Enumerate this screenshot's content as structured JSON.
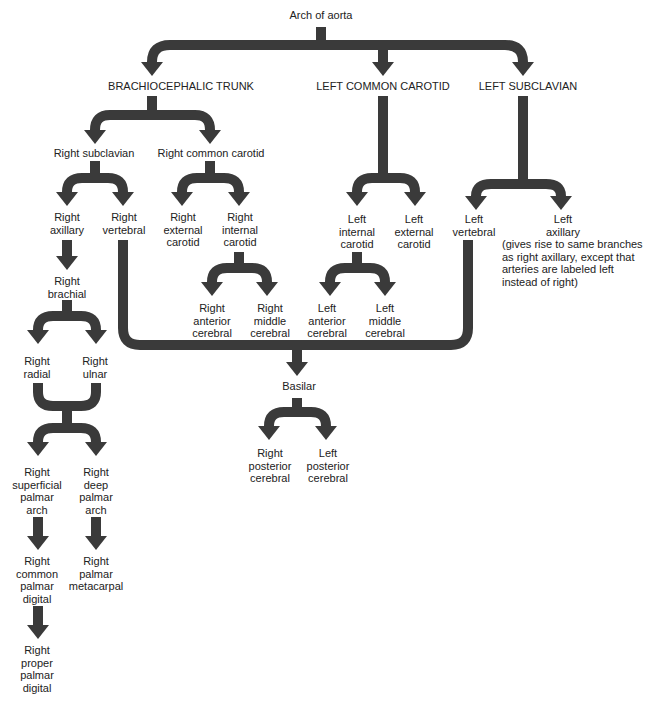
{
  "diagram": {
    "type": "arterial-branching-flowchart",
    "root": "Arch of aorta",
    "arrow_color": "#3a3a3a",
    "nodes": {
      "arch": "Arch of aorta",
      "brachiocephalic": "BRACHIOCEPHALIC TRUNK",
      "l_common_carotid": "LEFT COMMON CAROTID",
      "l_subclavian": "LEFT SUBCLAVIAN",
      "r_subclavian": "Right subclavian",
      "r_common_carotid": "Right common carotid",
      "r_axillary": "Right\naxillary",
      "r_vertebral": "Right\nvertebral",
      "r_external_carotid": "Right\nexternal\ncarotid",
      "r_internal_carotid": "Right\ninternal\ncarotid",
      "l_internal_carotid": "Left\ninternal\ncarotid",
      "l_external_carotid": "Left\nexternal\ncarotid",
      "l_vertebral": "Left\nvertebral",
      "l_axillary": "Left\naxillary",
      "l_axillary_note": "(gives rise to same branches\nas right axillary, except that\narteries are labeled left\ninstead of right)",
      "r_brachial": "Right\nbrachial",
      "r_anterior_cerebral": "Right\nanterior\ncerebral",
      "r_middle_cerebral": "Right\nmiddle\ncerebral",
      "l_anterior_cerebral": "Left\nanterior\ncerebral",
      "l_middle_cerebral": "Left\nmiddle\ncerebral",
      "r_radial": "Right\nradial",
      "r_ulnar": "Right\nulnar",
      "basilar": "Basilar",
      "r_posterior_cerebral": "Right\nposterior\ncerebral",
      "l_posterior_cerebral": "Left\nposterior\ncerebral",
      "r_superficial_palmar_arch": "Right\nsuperficial\npalmar\narch",
      "r_deep_palmar_arch": "Right\ndeep\npalmar\narch",
      "r_common_palmar_digital": "Right\ncommon\npalmar\ndigital",
      "r_palmar_metacarpal": "Right\npalmar\nmetacarpal",
      "r_proper_palmar_digital": "Right\nproper\npalmar\ndigital"
    },
    "edges": [
      [
        "Arch of aorta",
        "BRACHIOCEPHALIC TRUNK"
      ],
      [
        "Arch of aorta",
        "LEFT COMMON CAROTID"
      ],
      [
        "Arch of aorta",
        "LEFT SUBCLAVIAN"
      ],
      [
        "BRACHIOCEPHALIC TRUNK",
        "Right subclavian"
      ],
      [
        "BRACHIOCEPHALIC TRUNK",
        "Right common carotid"
      ],
      [
        "Right subclavian",
        "Right axillary"
      ],
      [
        "Right subclavian",
        "Right vertebral"
      ],
      [
        "Right common carotid",
        "Right external carotid"
      ],
      [
        "Right common carotid",
        "Right internal carotid"
      ],
      [
        "LEFT COMMON CAROTID",
        "Left internal carotid"
      ],
      [
        "LEFT COMMON CAROTID",
        "Left external carotid"
      ],
      [
        "LEFT SUBCLAVIAN",
        "Left vertebral"
      ],
      [
        "LEFT SUBCLAVIAN",
        "Left axillary"
      ],
      [
        "Right axillary",
        "Right brachial"
      ],
      [
        "Right internal carotid",
        "Right anterior cerebral"
      ],
      [
        "Right internal carotid",
        "Right middle cerebral"
      ],
      [
        "Left internal carotid",
        "Left anterior cerebral"
      ],
      [
        "Left internal carotid",
        "Left middle cerebral"
      ],
      [
        "Right vertebral",
        "Basilar"
      ],
      [
        "Left vertebral",
        "Basilar"
      ],
      [
        "Right brachial",
        "Right radial"
      ],
      [
        "Right brachial",
        "Right ulnar"
      ],
      [
        "Basilar",
        "Right posterior cerebral"
      ],
      [
        "Basilar",
        "Left posterior cerebral"
      ],
      [
        "Right radial",
        "Right superficial palmar arch"
      ],
      [
        "Right radial",
        "Right deep palmar arch"
      ],
      [
        "Right ulnar",
        "Right superficial palmar arch"
      ],
      [
        "Right ulnar",
        "Right deep palmar arch"
      ],
      [
        "Right superficial palmar arch",
        "Right common palmar digital"
      ],
      [
        "Right deep palmar arch",
        "Right palmar metacarpal"
      ],
      [
        "Right common palmar digital",
        "Right proper palmar digital"
      ]
    ]
  }
}
